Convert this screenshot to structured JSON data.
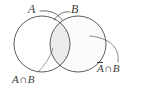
{
  "figure": {
    "type": "venn-diagram",
    "background_color": "#ffffff",
    "stroke_color": "#4a4a48",
    "label_color": "#3a3a38"
  },
  "labels": {
    "set_a": "A",
    "set_b": "B",
    "intersection": {
      "left_operand": "A",
      "operator": "∩",
      "right_operand": "B"
    },
    "complement_intersection": {
      "left_operand": "A",
      "left_overline": true,
      "operator": "∩",
      "right_operand": "B"
    }
  },
  "regions": {
    "circle_a": {
      "name": "A",
      "fill": "#ffffff",
      "cx": 42,
      "cy": 44,
      "r": 28
    },
    "circle_b": {
      "name": "B",
      "fill": "#fbfbfa",
      "cx": 78,
      "cy": 44,
      "r": 28
    },
    "lens": {
      "name": "A ∩ B",
      "fill": "#ececeb"
    }
  },
  "leaders": [
    {
      "name": "leader-a",
      "from": "A label",
      "to": "circle B upper-left arc"
    },
    {
      "name": "leader-b",
      "from": "B label",
      "to": "circle A upper-right arc"
    },
    {
      "name": "leader-intersection",
      "from": "A ∩ B label",
      "to": "lens region"
    },
    {
      "name": "leader-complement",
      "from": "Ā ∩ B label",
      "to": "circle B right arc"
    }
  ]
}
